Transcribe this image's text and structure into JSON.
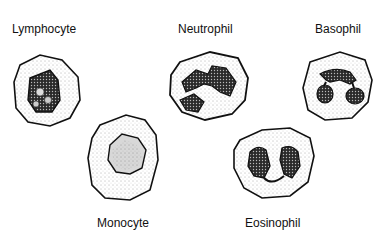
{
  "diagram": {
    "cells": [
      {
        "id": "lymphocyte",
        "label": "Lymphocyte"
      },
      {
        "id": "neutrophil",
        "label": "Neutrophil"
      },
      {
        "id": "basophil",
        "label": "Basophil"
      },
      {
        "id": "monocyte",
        "label": "Monocyte"
      },
      {
        "id": "eosinophil",
        "label": "Eosinophil"
      }
    ]
  }
}
